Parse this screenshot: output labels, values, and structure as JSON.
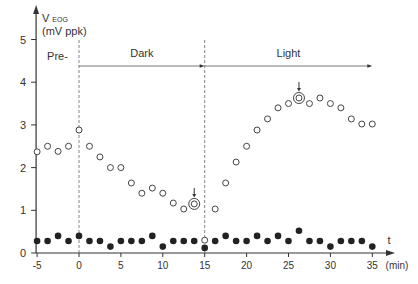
{
  "chart_data": {
    "type": "scatter",
    "title": "",
    "ylabel": "V EOG (mV ppk)",
    "ylabel_main": "V",
    "ylabel_sub": "EOG",
    "ylabel_unit": "(mV ppk)",
    "xlabel": "t",
    "xunit": "(min)",
    "xlim": [
      -5,
      36
    ],
    "ylim": [
      0,
      5.2
    ],
    "xticks": [
      -5,
      0,
      5,
      10,
      15,
      20,
      25,
      30,
      35
    ],
    "yticks": [
      0,
      1,
      2,
      3,
      4,
      5
    ],
    "grid": false,
    "phases": [
      {
        "label": "Pre-",
        "start": -5,
        "end": 0
      },
      {
        "label": "Dark",
        "start": 0,
        "end": 15
      },
      {
        "label": "Light",
        "start": 15,
        "end": 35
      }
    ],
    "phase_boundaries": [
      0,
      15
    ],
    "series": [
      {
        "name": "Open circles",
        "marker": "open",
        "x": [
          -5,
          -3.75,
          -2.5,
          -1.25,
          0,
          1.25,
          2.5,
          3.75,
          5,
          6.25,
          7.5,
          8.75,
          10,
          11.25,
          12.5,
          13.75,
          15,
          16.25,
          17.5,
          18.75,
          20,
          21.25,
          22.5,
          23.75,
          25,
          26.25,
          27.5,
          28.75,
          30,
          31.25,
          32.5,
          33.75,
          35
        ],
        "y": [
          2.37,
          2.5,
          2.38,
          2.5,
          2.88,
          2.5,
          2.25,
          2.0,
          2.0,
          1.64,
          1.4,
          1.52,
          1.4,
          1.17,
          1.03,
          1.15,
          0.3,
          1.03,
          1.64,
          2.13,
          2.5,
          2.88,
          3.14,
          3.4,
          3.5,
          3.63,
          3.5,
          3.63,
          3.5,
          3.4,
          3.14,
          3.02,
          3.02
        ]
      },
      {
        "name": "Filled circles",
        "marker": "filled",
        "x": [
          -5,
          -3.75,
          -2.5,
          -1.25,
          0,
          1.25,
          2.5,
          3.75,
          5,
          6.25,
          7.5,
          8.75,
          10,
          11.25,
          12.5,
          13.75,
          15,
          16.25,
          17.5,
          18.75,
          20,
          21.25,
          22.5,
          23.75,
          25,
          26.25,
          27.5,
          28.75,
          30,
          31.25,
          32.5,
          33.75,
          35
        ],
        "y": [
          0.28,
          0.28,
          0.4,
          0.28,
          0.4,
          0.28,
          0.28,
          0.15,
          0.28,
          0.28,
          0.28,
          0.4,
          0.15,
          0.28,
          0.28,
          0.28,
          0.12,
          0.28,
          0.4,
          0.28,
          0.28,
          0.4,
          0.28,
          0.4,
          0.28,
          0.52,
          0.28,
          0.28,
          0.15,
          0.28,
          0.28,
          0.28,
          0.15
        ]
      }
    ],
    "annotations": [
      {
        "type": "circled-point-with-arrow",
        "label": "dark trough",
        "x": 13.75,
        "y": 1.15
      },
      {
        "type": "circled-point-with-arrow",
        "label": "light peak",
        "x": 26.25,
        "y": 3.63
      }
    ]
  }
}
